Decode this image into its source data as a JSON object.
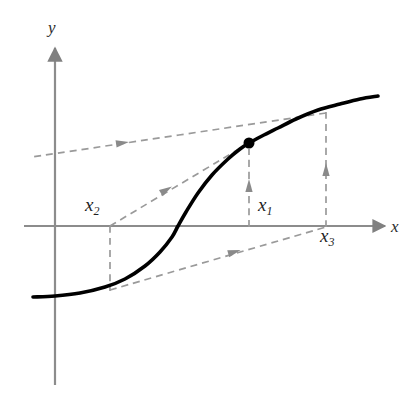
{
  "figure": {
    "background_color": "#ffffff",
    "curve_color": "#000000",
    "axis_color": "#808080",
    "dashed_color": "#9a9a9a",
    "point_color": "#000000",
    "axes": {
      "y_label": "y",
      "x_label": "x",
      "y_axis_x_px": 55,
      "x_axis_y_px": 226
    },
    "labels": [
      {
        "name": "x-sub-1",
        "base": "x",
        "sub": "1",
        "x_px": 258,
        "y_px": 196
      },
      {
        "name": "x-sub-2",
        "base": "x",
        "sub": "2",
        "x_px": 85,
        "y_px": 196
      },
      {
        "name": "x-sub-3",
        "base": "x",
        "sub": "3",
        "x_px": 320,
        "y_px": 226
      }
    ],
    "marked_point": {
      "name": "fixed-point-marker",
      "x_px": 249,
      "y_px": 143,
      "radius_px": 5.5
    }
  },
  "chart_data": {
    "type": "line",
    "title": "",
    "xlabel": "x",
    "ylabel": "y",
    "grid": false,
    "legend": null,
    "annotations": [
      {
        "text": "x1",
        "role": "iterate-label",
        "near_px": [
          258,
          196
        ]
      },
      {
        "text": "x2",
        "role": "iterate-label",
        "near_px": [
          85,
          196
        ]
      },
      {
        "text": "x3",
        "role": "iterate-label",
        "near_px": [
          320,
          226
        ]
      }
    ],
    "series": [
      {
        "name": "f(x) sigmoid curve",
        "style": "solid",
        "color": "#000000",
        "points_px": [
          [
            33,
            297
          ],
          [
            55,
            296
          ],
          [
            80,
            293
          ],
          [
            105,
            287
          ],
          [
            125,
            279
          ],
          [
            145,
            266
          ],
          [
            160,
            252
          ],
          [
            172,
            237
          ],
          [
            178,
            226
          ],
          [
            186,
            212
          ],
          [
            198,
            193
          ],
          [
            212,
            175
          ],
          [
            228,
            159
          ],
          [
            240,
            149
          ],
          [
            249,
            143
          ],
          [
            262,
            136
          ],
          [
            278,
            128
          ],
          [
            296,
            119
          ],
          [
            318,
            110
          ],
          [
            340,
            104
          ],
          [
            360,
            99
          ],
          [
            378,
            96
          ]
        ]
      },
      {
        "name": "cobweb step x3-to-x2 (upper dashed)",
        "style": "dashed",
        "color": "#9a9a9a",
        "arrow": "left",
        "arrow_at_px": [
          122,
          143
        ],
        "points_px": [
          [
            326,
            113
          ],
          [
            32,
            157
          ]
        ]
      },
      {
        "name": "cobweb step x2-to-x1 (middle dashed)",
        "style": "dashed",
        "color": "#9a9a9a",
        "arrow": "right",
        "arrow_at_px": [
          166,
          190
        ],
        "points_px": [
          [
            110,
            226
          ],
          [
            249,
            143
          ]
        ]
      },
      {
        "name": "cobweb step x2-to-x3 (lower dashed)",
        "style": "dashed",
        "color": "#9a9a9a",
        "arrow": "right",
        "arrow_at_px": [
          234,
          252
        ],
        "points_px": [
          [
            110,
            290
          ],
          [
            326,
            227
          ]
        ]
      },
      {
        "name": "vertical drop at x2",
        "style": "dashed",
        "color": "#9a9a9a",
        "arrow": "none",
        "points_px": [
          [
            110,
            226
          ],
          [
            110,
            291
          ]
        ]
      },
      {
        "name": "vertical rise at x1",
        "style": "dashed",
        "color": "#9a9a9a",
        "arrow": "up",
        "arrow_at_px": [
          249,
          186
        ],
        "points_px": [
          [
            249,
            227
          ],
          [
            249,
            149
          ]
        ]
      },
      {
        "name": "vertical rise at x3",
        "style": "dashed",
        "color": "#9a9a9a",
        "arrow": "up",
        "arrow_at_px": [
          326,
          170
        ],
        "points_px": [
          [
            326,
            227
          ],
          [
            326,
            112
          ]
        ]
      }
    ],
    "axis_lines_px": {
      "y_axis": [
        [
          55,
          48
        ],
        [
          55,
          385
        ]
      ],
      "x_axis": [
        [
          24,
          226
        ],
        [
          385,
          226
        ]
      ]
    }
  }
}
